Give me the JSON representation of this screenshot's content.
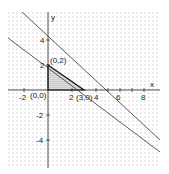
{
  "figure": {
    "axis_labels": {
      "x": "x",
      "y": "y"
    },
    "x_ticks": [
      {
        "value": -2,
        "label": "-2"
      },
      {
        "value": 2,
        "label": "2"
      },
      {
        "value": 4,
        "label": "4"
      },
      {
        "value": 6,
        "label": "6"
      },
      {
        "value": 8,
        "label": "8"
      }
    ],
    "y_ticks": [
      {
        "value": 4,
        "label": "4"
      },
      {
        "value": 2,
        "label": "2"
      },
      {
        "value": -2,
        "label": "-2"
      },
      {
        "value": -4,
        "label": "-4"
      }
    ],
    "points": [
      {
        "label": "(0,0)"
      },
      {
        "label": "(0,2)"
      },
      {
        "label": "(3,0)"
      }
    ],
    "lines": [
      {
        "description": "line through (0,4) and (4,0)"
      },
      {
        "description": "line through (0,2) and (3,0)"
      }
    ],
    "feasible_region": "triangle (0,0),(0,2),(3,0)"
  }
}
